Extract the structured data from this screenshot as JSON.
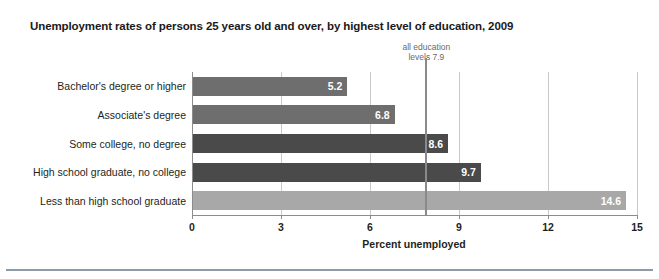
{
  "chart_data": {
    "type": "bar",
    "orientation": "horizontal",
    "title": "Unemployment rates of persons 25 years old and over, by highest level of education, 2009",
    "xlabel": "Percent unemployed",
    "ylabel": "",
    "categories": [
      "Bachelor's degree or higher",
      "Associate's degree",
      "Some college, no degree",
      "High school graduate, no college",
      "Less than high school graduate"
    ],
    "values": [
      5.2,
      6.8,
      8.6,
      9.7,
      14.6
    ],
    "value_labels": [
      "5.2",
      "6.8",
      "8.6",
      "9.7",
      "14.6"
    ],
    "bar_colors": [
      "#6e6e6e",
      "#6e6e6e",
      "#4a4a4a",
      "#4a4a4a",
      "#a8a8a8"
    ],
    "xlim": [
      0,
      15
    ],
    "xticks": [
      0,
      3,
      6,
      9,
      12,
      15
    ],
    "xtick_labels": [
      "0",
      "3",
      "6",
      "9",
      "12",
      "15"
    ],
    "grid": true,
    "legend": "none",
    "annotations": [
      {
        "name": "all-education-levels-reference",
        "line1": "all education",
        "line2": "levels 7.9",
        "value": 7.9
      }
    ]
  },
  "colors": {
    "axis": "#8c8c8c",
    "grid": "#c9c9c9",
    "reference_line": "#8a8a8a",
    "annotation_text": "#6a6a6a",
    "bottom_rule": "#8e9aa6",
    "text": "#231f20",
    "value_text": "#ffffff"
  }
}
